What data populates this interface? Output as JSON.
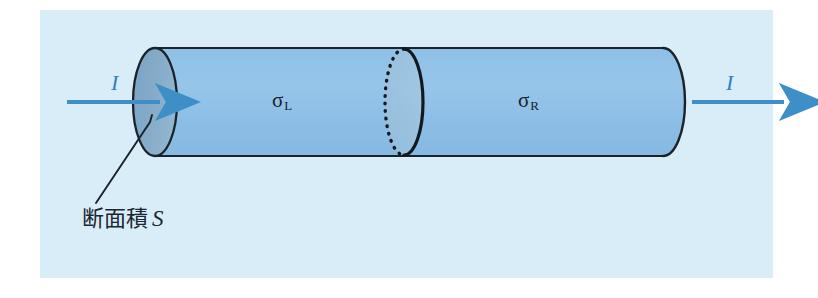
{
  "figure": {
    "background_color": "#ffffff",
    "panel_color": "#d9edf8",
    "cylinder_body_color": "#8fc0e6",
    "cylinder_cap_color": "#7fa6c6",
    "outline_color": "#1b2328",
    "arrow_color": "#3e8fc8",
    "text_color": "#1b2630"
  },
  "labels": {
    "sigma_left": "σ",
    "sigma_left_sub": "L",
    "sigma_right": "σ",
    "sigma_right_sub": "R",
    "current_in": "I",
    "current_out": "I",
    "area_text": "断面積",
    "area_symbol": "S"
  },
  "geometry": {
    "cylinder_left_x": 155,
    "cylinder_right_x": 663,
    "cylinder_top_y": 48,
    "cylinder_bottom_y": 156,
    "cap_rx": 22,
    "interface_x": 404
  }
}
